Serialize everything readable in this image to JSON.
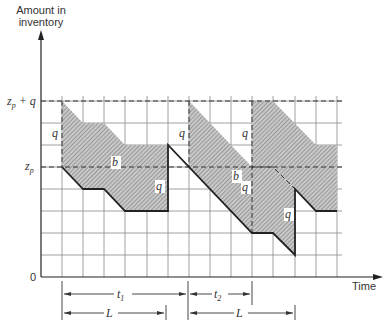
{
  "diagram": {
    "y_axis_label_line1": "Amount in",
    "y_axis_label_line2": "inventory",
    "x_axis_label": "Time",
    "origin_label": "0",
    "level_labels": {
      "zp_plus_q": {
        "main": "z",
        "sub": "p",
        "suffix": " + q"
      },
      "zp": {
        "main": "z",
        "sub": "p"
      }
    },
    "region_labels": [
      "q",
      "b",
      "q",
      "q",
      "b",
      "q",
      "q"
    ],
    "dimension_labels": {
      "t1": {
        "main": "t",
        "sub": "1"
      },
      "t2": {
        "main": "t",
        "sub": "2"
      },
      "L1": "L",
      "L2": "L"
    },
    "levels": {
      "zp": 5,
      "q": 3,
      "zp_plus_q": 8
    },
    "colors": {
      "shade": "#b9b9b9",
      "line": "#222222",
      "grid": "#888888"
    }
  }
}
